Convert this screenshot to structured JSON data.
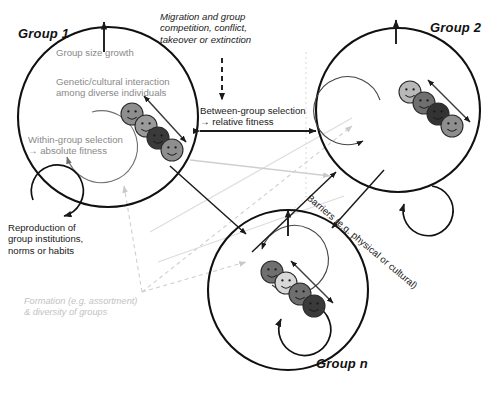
{
  "figure": {
    "type": "conceptual-diagram",
    "background": "#ffffff"
  },
  "groups": [
    {
      "id": "group1",
      "label": "Group 1",
      "faces": 4
    },
    {
      "id": "group2",
      "label": "Group 2",
      "faces": 4
    },
    {
      "id": "groupn",
      "label": "Group n",
      "faces": 4
    }
  ],
  "labels": {
    "group_size_growth": "Group size growth",
    "genetic_cultural": "Genetic/cultural interaction\namong diverse individuals",
    "within_group": "Within-group selection\n→ absolute fitness",
    "migration": "Migration and group\ncompetition, conflict,\ntakeover or extinction",
    "between_group": "Between-group selection\n→ relative fitness",
    "reproduction": "Reproduction of\ngroup institutions,\nnorms or habits",
    "formation": "Formation (e.g. assortment)\n& diversity of groups",
    "barriers": "Barriers (e.g. physical or cultural)"
  },
  "colors": {
    "outline": "#111111",
    "gray_text": "#8a8a8a",
    "pale_text": "#c2c2c2",
    "dark_text": "#1a1a1a",
    "face_light": "#d8d8d8",
    "face_mid": "#8e8e8e",
    "face_dark": "#4a4a4a",
    "face_darkest": "#2e2e2e",
    "dashed_gray": "#9a9a9a",
    "pale_dashed": "#d6d6d6"
  },
  "arrows": {
    "group_size_growth": "up-arrow into Group 1 top",
    "migration_dashed": "vertical dashed arrow pointing down",
    "between_group": "horizontal double-ended solid arrow",
    "within_group_loop": "circular arrow inside group",
    "reproduction_loop": "small circular arrow outside group",
    "interaction": "double-headed diagonal arrow across faces",
    "formation_dashed": "dashed arrows fanning to each group"
  }
}
